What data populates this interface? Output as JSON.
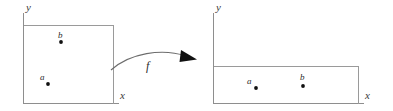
{
  "figure": {
    "background_color": "#ffffff",
    "line_color": "#9a9a9a",
    "ink_color": "#111111",
    "width": 393,
    "height": 111
  },
  "left_panel": {
    "axis_y_label": "y",
    "axis_x_label": "x",
    "region_shape": "tall-rectangle",
    "points": [
      {
        "label": "b",
        "x": 61,
        "y": 42
      },
      {
        "label": "a",
        "x": 48,
        "y": 84
      }
    ]
  },
  "mapping": {
    "label": "f",
    "arrow_direction": "left-to-right"
  },
  "right_panel": {
    "axis_y_label": "y",
    "axis_x_label": "x",
    "region_shape": "wide-rectangle",
    "points": [
      {
        "label": "a",
        "x": 256,
        "y": 88
      },
      {
        "label": "b",
        "x": 303,
        "y": 86
      }
    ]
  }
}
